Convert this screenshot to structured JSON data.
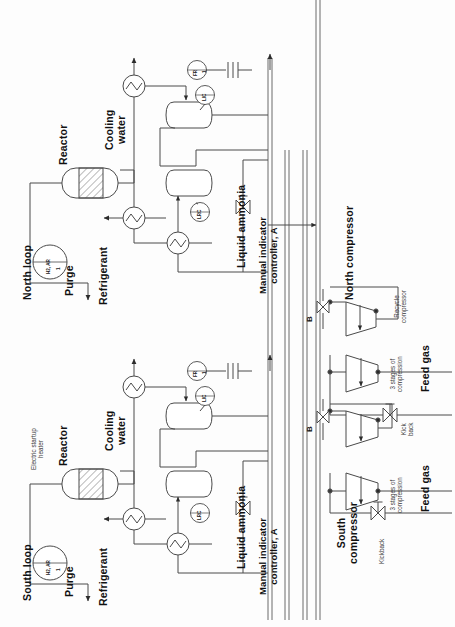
{
  "diagram": {
    "orientation": "rotated-90",
    "background_color": "#fdfdfd",
    "line_color": "#4a4a4a",
    "text_color": "#111111"
  },
  "loops": {
    "north": {
      "name": "North loop",
      "reactor_label": "Reactor",
      "purge_label": "Purge",
      "refrigerant_label": "Refrigerant",
      "cooling_water_label": "Cooling\nwater",
      "liquid_ammonia_label": "Liquid ammonia",
      "manual_controller_label": "Manual indicator\ncontroller, A",
      "feed_instrument": "H2, AR",
      "feed_instrument_tag": "1",
      "instruments": {
        "flow_recorder": "FR",
        "flow_recorder_tag": "1",
        "level_indicator_controller": "LIC",
        "level_recorder_controller": "LRC"
      }
    },
    "south": {
      "name": "South loop",
      "reactor_label": "Reactor",
      "startup_heater_label": "Electric startup\nheater",
      "purge_label": "Purge",
      "refrigerant_label": "Refrigerant",
      "cooling_water_label": "Cooling\nwater",
      "liquid_ammonia_label": "Liquid ammonia",
      "manual_controller_label": "Manual indicator\ncontroller, A",
      "feed_instrument": "H2, AR",
      "feed_instrument_tag": "1",
      "instruments": {
        "flow_recorder": "FR",
        "flow_recorder_tag": "1",
        "level_indicator_controller": "LIC",
        "level_recorder_controller": "LRC"
      }
    }
  },
  "compressors": {
    "north": {
      "name": "North compressor",
      "recycle_label": "Recycle\ncompressor",
      "stages_label": "3 stages of\ncompression",
      "feed_gas_label": "Feed gas",
      "kickback_label": "Kick\nback",
      "bypass_marker": "B"
    },
    "south": {
      "name": "South\ncompressor",
      "stages_label": "3 stages of\ncompression",
      "feed_gas_label": "Feed gas",
      "kickback_label": "Kickback",
      "bypass_marker": "B"
    }
  },
  "legend": {
    "reactor_symbol": "hatched-bed-vessel",
    "exchanger_symbol": "circle-zigzag",
    "separator_symbol": "horizontal-drum",
    "valve_symbol": "bowtie-control-valve",
    "compressor_symbol": "trapezoid",
    "instrument_symbol": "circle-bubble"
  }
}
